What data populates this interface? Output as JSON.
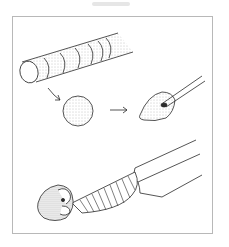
{
  "figure": {
    "type": "line-art process illustration",
    "steps": [
      {
        "name": "sliced-cylinder",
        "description": "Stippled cylinder marked into slices"
      },
      {
        "name": "ball",
        "description": "Stippled sphere formed from a slice"
      },
      {
        "name": "cone-on-stick",
        "description": "Sphere shaped into a cone around a stick"
      },
      {
        "name": "attached-to-handle",
        "description": "Cone fixed to the hatched end of a long handle"
      }
    ],
    "arrows": 2,
    "colors": {
      "line": "#2a2a2a",
      "stipple": "#8a8a8a",
      "frame": "#b8b8b8",
      "background": "#ffffff"
    }
  }
}
